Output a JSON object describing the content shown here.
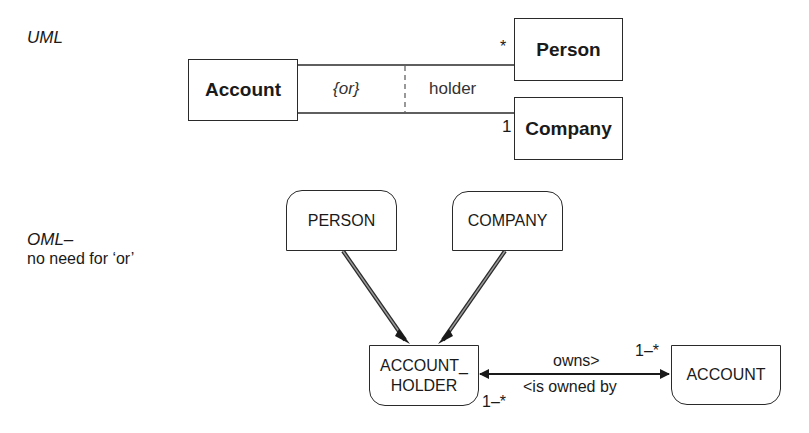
{
  "uml_section": {
    "heading": "UML",
    "classes": {
      "account": "Account",
      "person": "Person",
      "company": "Company"
    },
    "constraint": "{or}",
    "role": "holder",
    "multiplicity_person": "*",
    "multiplicity_company": "1"
  },
  "oml_section": {
    "heading": "OML–",
    "subheading": "no need for ‘or’",
    "entities": {
      "person": "PERSON",
      "company": "COMPANY",
      "account_holder_line1": "ACCOUNT_",
      "account_holder_line2": "HOLDER",
      "account": "ACCOUNT"
    },
    "relationship": {
      "forward": "owns>",
      "reverse": "<is owned by",
      "multiplicity_account": "1–*",
      "multiplicity_holder": "1–*"
    }
  },
  "colors": {
    "line": "#2a2a2a",
    "background": "#ffffff"
  }
}
